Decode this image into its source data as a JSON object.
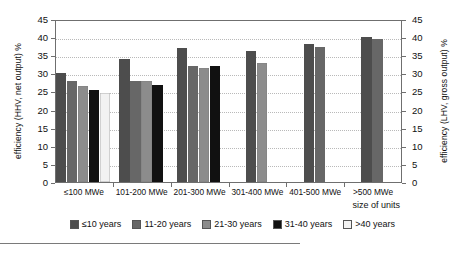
{
  "chart_data": {
    "type": "bar",
    "title": "",
    "subtitle": "",
    "xlabel": "size of units",
    "ylabel": "efficiency (HHV, net output) %",
    "ylabel_right": "efficiency (LHV, gross output) %",
    "ylim": [
      0,
      45
    ],
    "ylim_right": [
      0,
      45
    ],
    "yticks": [
      0,
      5,
      10,
      15,
      20,
      25,
      30,
      35,
      40,
      45
    ],
    "yticks_right": [
      0,
      5,
      10,
      15,
      20,
      25,
      30,
      35,
      40,
      45
    ],
    "grid": true,
    "legend_position": "bottom",
    "categories": [
      "≤100 MWe",
      "101-200 MWe",
      "201-300 MWe",
      "301-400 MWe",
      "401-500 MWe",
      ">500 MWe"
    ],
    "series": [
      {
        "name": "≤10 years",
        "color": "#4d4d4d",
        "values": [
          30.2,
          34.0,
          37.0,
          36.3,
          38.0,
          40.0
        ]
      },
      {
        "name": "11-20 years",
        "color": "#676767",
        "values": [
          28.0,
          28.0,
          32.0,
          null,
          37.3,
          39.5
        ]
      },
      {
        "name": "21-30 years",
        "color": "#8c8c8c",
        "values": [
          26.5,
          27.8,
          31.5,
          32.8,
          null,
          null
        ]
      },
      {
        "name": "31-40 years",
        "color": "#111111",
        "values": [
          25.3,
          26.8,
          32.0,
          null,
          null,
          null
        ]
      },
      {
        "name": ">40 years",
        "color": "#f2f2f2",
        "values": [
          24.6,
          null,
          null,
          null,
          null,
          null
        ]
      }
    ]
  },
  "legend": {
    "items": [
      {
        "label": "≤10 years",
        "color": "#4d4d4d"
      },
      {
        "label": "11-20 years",
        "color": "#676767"
      },
      {
        "label": "21-30 years",
        "color": "#8c8c8c"
      },
      {
        "label": "31-40 years",
        "color": "#111111"
      },
      {
        "label": ">40 years",
        "color": "#f2f2f2"
      }
    ]
  }
}
